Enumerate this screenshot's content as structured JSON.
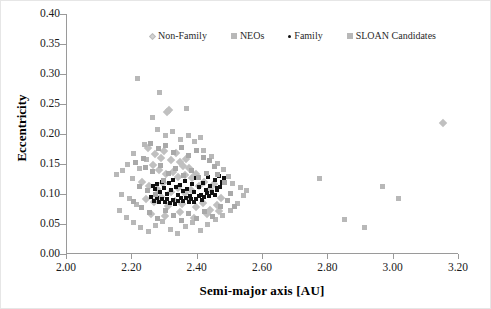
{
  "chart_data": {
    "type": "scatter",
    "title": "",
    "xlabel": "Semi-major axis [AU]",
    "ylabel": "Eccentricity",
    "xlim": [
      2.0,
      3.2
    ],
    "ylim": [
      0.0,
      0.4
    ],
    "xticks": [
      "2.00",
      "2.20",
      "2.40",
      "2.60",
      "2.80",
      "3.00",
      "3.20"
    ],
    "xtick_values": [
      2.0,
      2.2,
      2.4,
      2.6,
      2.8,
      3.0,
      3.2
    ],
    "yticks": [
      "0.00",
      "0.05",
      "0.10",
      "0.15",
      "0.20",
      "0.25",
      "0.30",
      "0.35",
      "0.40"
    ],
    "ytick_values": [
      0.0,
      0.05,
      0.1,
      0.15,
      0.2,
      0.25,
      0.3,
      0.35,
      0.4
    ],
    "grid": false,
    "legend_position": "top-inside",
    "series": [
      {
        "name": "Non-Family",
        "marker": "diamond",
        "color": "#c0c0c0",
        "points": [
          [
            2.305,
            0.237
          ],
          [
            2.311,
            0.24
          ],
          [
            2.247,
            0.176
          ],
          [
            2.268,
            0.166
          ],
          [
            2.289,
            0.16
          ],
          [
            2.296,
            0.172
          ],
          [
            2.318,
            0.156
          ],
          [
            2.333,
            0.168
          ],
          [
            2.347,
            0.154
          ],
          [
            2.356,
            0.147
          ],
          [
            2.365,
            0.159
          ],
          [
            2.374,
            0.143
          ],
          [
            2.262,
            0.149
          ],
          [
            2.281,
            0.14
          ],
          [
            2.302,
            0.133
          ],
          [
            2.324,
            0.137
          ],
          [
            2.34,
            0.128
          ],
          [
            2.361,
            0.131
          ],
          [
            2.383,
            0.126
          ],
          [
            2.395,
            0.134
          ],
          [
            2.23,
            0.12
          ],
          [
            2.252,
            0.114
          ],
          [
            2.274,
            0.108
          ],
          [
            2.295,
            0.118
          ],
          [
            2.317,
            0.104
          ],
          [
            2.339,
            0.11
          ],
          [
            2.36,
            0.101
          ],
          [
            2.381,
            0.107
          ],
          [
            2.403,
            0.113
          ],
          [
            2.42,
            0.12
          ],
          [
            2.437,
            0.109
          ],
          [
            2.451,
            0.116
          ],
          [
            2.243,
            0.092
          ],
          [
            2.265,
            0.086
          ],
          [
            2.287,
            0.095
          ],
          [
            2.308,
            0.08
          ],
          [
            2.33,
            0.089
          ],
          [
            2.352,
            0.083
          ],
          [
            2.373,
            0.091
          ],
          [
            2.394,
            0.078
          ],
          [
            2.416,
            0.085
          ],
          [
            2.438,
            0.074
          ],
          [
            2.459,
            0.082
          ],
          [
            2.47,
            0.093
          ],
          [
            2.258,
            0.067
          ],
          [
            2.3,
            0.063
          ],
          [
            2.345,
            0.07
          ],
          [
            2.388,
            0.06
          ],
          [
            2.43,
            0.066
          ],
          [
            2.465,
            0.072
          ],
          [
            3.152,
            0.218
          ]
        ]
      },
      {
        "name": "NEOs",
        "marker": "square",
        "color": "#b8b8b8",
        "points": [
          [
            2.216,
            0.293
          ],
          [
            2.283,
            0.27
          ],
          [
            2.367,
            0.243
          ],
          [
            2.262,
            0.228
          ],
          [
            2.277,
            0.208
          ],
          [
            2.3,
            0.198
          ],
          [
            2.324,
            0.204
          ],
          [
            2.348,
            0.191
          ],
          [
            2.372,
            0.197
          ],
          [
            2.39,
            0.188
          ],
          [
            2.41,
            0.195
          ],
          [
            2.236,
            0.183
          ],
          [
            2.205,
            0.168
          ],
          [
            2.186,
            0.15
          ],
          [
            2.169,
            0.139
          ],
          [
            2.152,
            0.132
          ],
          [
            2.199,
            0.126
          ],
          [
            2.221,
            0.143
          ],
          [
            2.243,
            0.158
          ],
          [
            2.419,
            0.172
          ],
          [
            2.441,
            0.163
          ],
          [
            2.462,
            0.151
          ],
          [
            2.478,
            0.141
          ],
          [
            2.493,
            0.129
          ],
          [
            2.508,
            0.118
          ],
          [
            2.531,
            0.111
          ],
          [
            2.548,
            0.106
          ],
          [
            2.168,
            0.1
          ],
          [
            2.191,
            0.093
          ],
          [
            2.213,
            0.082
          ],
          [
            2.16,
            0.073
          ],
          [
            2.182,
            0.061
          ],
          [
            2.204,
            0.053
          ],
          [
            2.226,
            0.044
          ],
          [
            2.248,
            0.038
          ],
          [
            2.271,
            0.047
          ],
          [
            2.293,
            0.055
          ],
          [
            2.316,
            0.041
          ],
          [
            2.339,
            0.035
          ],
          [
            2.362,
            0.046
          ],
          [
            2.385,
            0.052
          ],
          [
            2.408,
            0.039
          ],
          [
            2.431,
            0.05
          ],
          [
            2.454,
            0.057
          ],
          [
            2.476,
            0.065
          ],
          [
            2.499,
            0.073
          ],
          [
            2.523,
            0.085
          ],
          [
            2.541,
            0.097
          ],
          [
            2.849,
            0.058
          ],
          [
            2.91,
            0.045
          ],
          [
            3.015,
            0.092
          ],
          [
            2.966,
            0.112
          ],
          [
            2.772,
            0.126
          ]
        ]
      },
      {
        "name": "Family",
        "marker": "dot",
        "color": "#111111",
        "points": [
          [
            2.262,
            0.113
          ],
          [
            2.27,
            0.108
          ],
          [
            2.277,
            0.116
          ],
          [
            2.284,
            0.104
          ],
          [
            2.291,
            0.12
          ],
          [
            2.298,
            0.11
          ],
          [
            2.305,
            0.1
          ],
          [
            2.312,
            0.118
          ],
          [
            2.319,
            0.107
          ],
          [
            2.326,
            0.124
          ],
          [
            2.333,
            0.112
          ],
          [
            2.34,
            0.098
          ],
          [
            2.347,
            0.115
          ],
          [
            2.354,
            0.105
          ],
          [
            2.361,
            0.122
          ],
          [
            2.368,
            0.109
          ],
          [
            2.375,
            0.096
          ],
          [
            2.382,
            0.117
          ],
          [
            2.389,
            0.103
          ],
          [
            2.396,
            0.126
          ],
          [
            2.403,
            0.111
          ],
          [
            2.41,
            0.099
          ],
          [
            2.417,
            0.119
          ],
          [
            2.424,
            0.106
          ],
          [
            2.431,
            0.129
          ],
          [
            2.438,
            0.114
          ],
          [
            2.445,
            0.101
          ],
          [
            2.452,
            0.123
          ],
          [
            2.459,
            0.11
          ],
          [
            2.466,
            0.13
          ],
          [
            2.473,
            0.118
          ],
          [
            2.258,
            0.095
          ],
          [
            2.266,
            0.089
          ],
          [
            2.274,
            0.093
          ],
          [
            2.282,
            0.087
          ],
          [
            2.29,
            0.092
          ],
          [
            2.299,
            0.086
          ],
          [
            2.307,
            0.091
          ],
          [
            2.315,
            0.085
          ],
          [
            2.323,
            0.09
          ],
          [
            2.331,
            0.084
          ],
          [
            2.339,
            0.089
          ],
          [
            2.348,
            0.094
          ],
          [
            2.356,
            0.088
          ],
          [
            2.364,
            0.093
          ],
          [
            2.372,
            0.087
          ],
          [
            2.38,
            0.092
          ],
          [
            2.388,
            0.086
          ],
          [
            2.396,
            0.091
          ],
          [
            2.404,
            0.097
          ],
          [
            2.412,
            0.09
          ],
          [
            2.42,
            0.095
          ],
          [
            2.428,
            0.102
          ],
          [
            2.436,
            0.096
          ],
          [
            2.444,
            0.104
          ],
          [
            2.452,
            0.098
          ],
          [
            2.46,
            0.106
          ],
          [
            2.468,
            0.112
          ],
          [
            2.476,
            0.12
          ],
          [
            2.482,
            0.127
          ]
        ]
      },
      {
        "name": "SLOAN Candidates",
        "marker": "square",
        "color": "#a9a9a9",
        "points": [
          [
            2.256,
            0.185
          ],
          [
            2.279,
            0.176
          ],
          [
            2.302,
            0.181
          ],
          [
            2.325,
            0.17
          ],
          [
            2.349,
            0.178
          ],
          [
            2.372,
            0.165
          ],
          [
            2.395,
            0.173
          ],
          [
            2.418,
            0.161
          ],
          [
            2.233,
            0.16
          ],
          [
            2.211,
            0.153
          ],
          [
            2.24,
            0.145
          ],
          [
            2.263,
            0.138
          ],
          [
            2.286,
            0.147
          ],
          [
            2.31,
            0.135
          ],
          [
            2.333,
            0.142
          ],
          [
            2.357,
            0.131
          ],
          [
            2.38,
            0.139
          ],
          [
            2.404,
            0.127
          ],
          [
            2.427,
            0.134
          ],
          [
            2.45,
            0.146
          ],
          [
            2.223,
            0.113
          ],
          [
            2.247,
            0.106
          ],
          [
            2.271,
            0.099
          ],
          [
            2.294,
            0.122
          ],
          [
            2.437,
            0.156
          ],
          [
            2.46,
            0.132
          ],
          [
            2.483,
            0.119
          ],
          [
            2.5,
            0.101
          ],
          [
            2.205,
            0.088
          ],
          [
            2.229,
            0.077
          ],
          [
            2.253,
            0.069
          ],
          [
            2.277,
            0.06
          ],
          [
            2.301,
            0.072
          ],
          [
            2.325,
            0.064
          ],
          [
            2.349,
            0.056
          ],
          [
            2.373,
            0.068
          ],
          [
            2.397,
            0.059
          ],
          [
            2.421,
            0.071
          ],
          [
            2.445,
            0.063
          ],
          [
            2.469,
            0.079
          ],
          [
            2.492,
            0.09
          ],
          [
            2.514,
            0.079
          ]
        ]
      }
    ]
  },
  "legend": {
    "items": [
      {
        "label": "Non-Family",
        "marker": "diamond-icon"
      },
      {
        "label": "NEOs",
        "marker": "square-icon"
      },
      {
        "label": "Family",
        "marker": "dot-icon"
      },
      {
        "label": "SLOAN Candidates",
        "marker": "square-icon"
      }
    ]
  },
  "axes": {
    "x_title": "Semi-major axis [AU]",
    "y_title": "Eccentricity"
  }
}
